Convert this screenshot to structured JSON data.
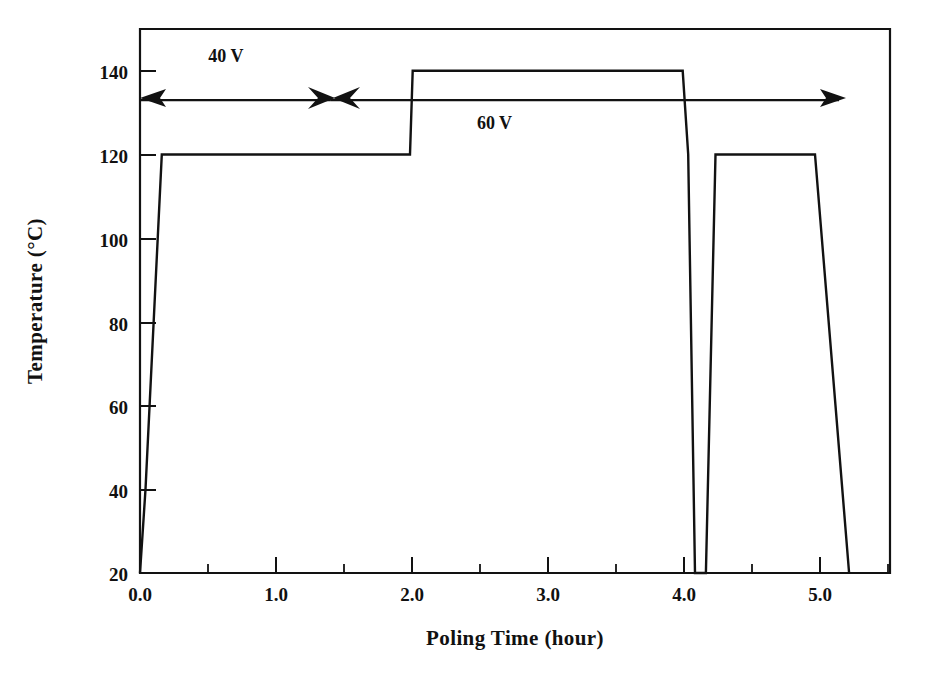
{
  "figure": {
    "caption": "",
    "background": "#ffffff",
    "ink_color": "#121212"
  },
  "chart_data": {
    "type": "line",
    "title": "",
    "subtitle": "",
    "xlabel": "Poling Time (hour)",
    "ylabel": "Temperature (°C)",
    "xlim": [
      0.0,
      5.5
    ],
    "ylim": [
      20,
      150
    ],
    "grid": false,
    "legend_position": "none",
    "x_ticks": [
      0.0,
      1.0,
      2.0,
      3.0,
      4.0,
      5.0
    ],
    "x_tick_labels": [
      "0.0",
      "1.0",
      "2.0",
      "3.0",
      "4.0",
      "5.0"
    ],
    "x_minor_ticks": [
      0.5,
      1.5,
      2.5,
      3.5,
      4.5,
      5.5
    ],
    "y_ticks": [
      20,
      40,
      60,
      80,
      100,
      120,
      140
    ],
    "y_tick_labels": [
      "20",
      "40",
      "60",
      "80",
      "100",
      "120",
      "140"
    ],
    "series": [
      {
        "name": "Poling temperature profile",
        "x": [
          0.0,
          0.04,
          0.16,
          1.98,
          2.0,
          3.98,
          4.02,
          4.07,
          4.15,
          4.22,
          4.95,
          5.1,
          5.2
        ],
        "y": [
          20,
          40,
          120,
          120,
          140,
          140,
          120,
          20,
          20,
          120,
          120,
          60,
          20
        ],
        "units_x": "hour",
        "units_y": "°C"
      }
    ],
    "annotations": [
      {
        "id": "annot-40v",
        "label": "40 V",
        "label_x": 0.63,
        "label_y": 142,
        "span_x": [
          0.0,
          1.4
        ],
        "span_y": 133,
        "arrow": "left"
      },
      {
        "id": "annot-60v",
        "label": "60 V",
        "label_x": 2.6,
        "label_y": 126,
        "span_x": [
          1.4,
          5.17
        ],
        "span_y": 133,
        "arrow": "right"
      }
    ],
    "plateaus": [
      {
        "temperature": 120,
        "from_hour": 0.16,
        "to_hour": 1.98
      },
      {
        "temperature": 140,
        "from_hour": 2.0,
        "to_hour": 3.98
      },
      {
        "temperature": 120,
        "from_hour": 4.22,
        "to_hour": 4.95
      }
    ]
  }
}
